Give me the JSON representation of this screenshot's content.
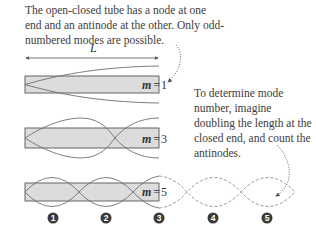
{
  "captions": {
    "top": "The open-closed tube has a node at one end and an antinode at the other. Only odd-numbered modes are possible.",
    "right": "To determine mode number, imagine doubling the length at the closed end, and count the antinodes."
  },
  "length_label": "L",
  "tubes": [
    {
      "m_var": "m",
      "eq": "=",
      "m_value": "1"
    },
    {
      "m_var": "m",
      "eq": "=",
      "m_value": "3"
    },
    {
      "m_var": "m",
      "eq": "=",
      "m_value": "5"
    }
  ],
  "antinode_markers": [
    "1",
    "2",
    "3",
    "4",
    "5"
  ],
  "colors": {
    "tube_fill": "#dcdcdc",
    "tube_border": "#555555",
    "wave_line": "#6e6e6e",
    "dashed_wave": "#8a8a8a",
    "marker_fill": "#3a3a3a"
  }
}
